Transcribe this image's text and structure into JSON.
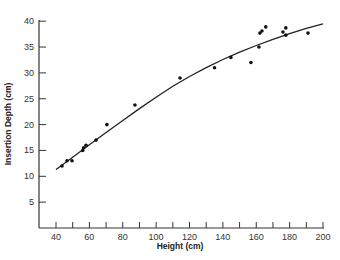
{
  "chart_data": {
    "type": "scatter",
    "title": "",
    "xlabel": "Height (cm)",
    "ylabel": "Insertion Depth (cm)",
    "xlim": [
      30,
      200
    ],
    "ylim": [
      0,
      40
    ],
    "xticks": [
      40,
      50,
      60,
      70,
      80,
      90,
      100,
      110,
      120,
      130,
      140,
      150,
      160,
      170,
      180,
      190,
      200
    ],
    "xtick_labels": [
      "40",
      "60",
      "80",
      "100",
      "120",
      "140",
      "160",
      "180",
      "200"
    ],
    "yticks": [
      5,
      10,
      15,
      20,
      25,
      30,
      35,
      40
    ],
    "ytick_labels": [
      "5",
      "10",
      "15",
      "20",
      "25",
      "30",
      "35",
      "40"
    ],
    "grid": false,
    "legend": null,
    "series": [
      {
        "name": "observations",
        "kind": "points",
        "x": [
          43.6,
          46.6,
          49.6,
          56,
          56.5,
          58,
          64,
          70.5,
          87.3,
          114.3,
          135,
          144.8,
          156.8,
          161.6,
          162.2,
          163.4,
          165.7,
          176,
          177.7,
          177.7,
          191
        ],
        "y": [
          12,
          13,
          13,
          15,
          15.5,
          16,
          17,
          20,
          23.8,
          29,
          31,
          33,
          32,
          35,
          37.7,
          38.1,
          38.9,
          37.9,
          38.7,
          37.3,
          37.7
        ]
      },
      {
        "name": "fitted curve",
        "kind": "line",
        "x": [
          40,
          50,
          60,
          70,
          80,
          90,
          100,
          110,
          120,
          130,
          140,
          150,
          160,
          170,
          180,
          190,
          200
        ],
        "y": [
          11.3,
          13.7,
          16.1,
          18.5,
          20.8,
          23.1,
          25.3,
          27.4,
          29.3,
          31.0,
          32.6,
          34.0,
          35.3,
          36.5,
          37.6,
          38.6,
          39.5
        ]
      }
    ]
  }
}
